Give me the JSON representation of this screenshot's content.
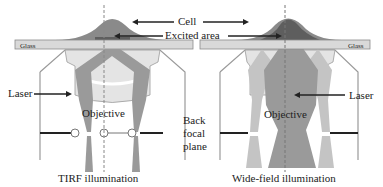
{
  "labels": {
    "cell": "Cell",
    "excited_area": "Excited area",
    "glass_left": "Glass",
    "glass_right": "Glass",
    "laser_left": "Laser",
    "laser_right": "Laser",
    "objective_left": "Objective",
    "objective_right": "Objective",
    "back_focal_plane": [
      "Back",
      "focal",
      "plane"
    ],
    "tirf_caption": "TIRF illumination",
    "widefield_caption": "Wide-field illumination"
  },
  "colors": {
    "cell": "#8a8a8a",
    "cell_dark": "#5e5e5e",
    "glass": "#d9d9d9",
    "beam": "#9a9a9a",
    "lens": "#e6e6e6",
    "outline": "#8c8c8c"
  }
}
